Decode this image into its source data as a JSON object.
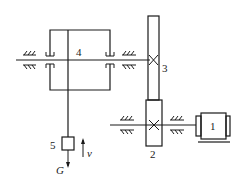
{
  "diagram": {
    "type": "mechanical transmission schematic (hoist)",
    "components": [
      {
        "id": "1",
        "label": "1",
        "kind": "motor"
      },
      {
        "id": "2",
        "label": "2",
        "kind": "pinion gear"
      },
      {
        "id": "3",
        "label": "3",
        "kind": "gear"
      },
      {
        "id": "4",
        "label": "4",
        "kind": "drum"
      },
      {
        "id": "5",
        "label": "5",
        "kind": "load block"
      }
    ],
    "annotations": {
      "velocity": "v",
      "weight": "G"
    }
  }
}
